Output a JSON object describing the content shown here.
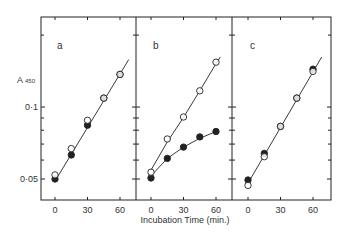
{
  "chart_data": {
    "type": "scatter",
    "title": "",
    "xlabel": "Incubation Time (min.)",
    "ylabel": "A 450",
    "ylabel_main": "A",
    "ylabel_sub": "450",
    "yscale": "log",
    "ylim": [
      0.045,
      0.21
    ],
    "xlim": [
      -13,
      77
    ],
    "xticks": [
      0,
      30,
      60
    ],
    "xtick_labels": [
      "0",
      "30",
      "60"
    ],
    "yticks_labeled": [
      0.05,
      0.1
    ],
    "ytick_labels": [
      "0·05",
      "0·1"
    ],
    "yticks_minor": [
      0.06,
      0.07,
      0.08,
      0.09,
      0.2
    ],
    "grid": false,
    "legend": "none",
    "marker_styles": {
      "open": "open circle",
      "filled": "filled circle",
      "half": "half-filled circle"
    },
    "panels": [
      {
        "label": "a",
        "x": [
          0,
          15,
          30,
          45,
          60
        ],
        "series": [
          {
            "name": "open",
            "marker": "open",
            "values": [
              0.052,
              0.067,
              0.088,
              0.109,
              0.137
            ]
          },
          {
            "name": "filled",
            "marker": "filled",
            "values": [
              0.05,
              0.063,
              0.084,
              0.109,
              0.137
            ]
          }
        ],
        "fit_lines": [
          {
            "x": [
              0,
              68
            ],
            "y": [
              0.049,
              0.158
            ]
          }
        ]
      },
      {
        "label": "b",
        "x": [
          0,
          15,
          30,
          45,
          60
        ],
        "series": [
          {
            "name": "open",
            "marker": "open",
            "values": [
              0.0534,
              0.0735,
              0.0909,
              0.117,
              0.154
            ]
          },
          {
            "name": "filled",
            "marker": "filled",
            "values": [
              0.0505,
              0.061,
              0.068,
              0.075,
              0.079
            ]
          }
        ],
        "fit_lines": [
          {
            "x": [
              0,
              15,
              30,
              45,
              60,
              64
            ],
            "y": [
              0.0545,
              0.0715,
              0.0905,
              0.117,
              0.152,
              0.162
            ]
          },
          {
            "x": [
              0,
              15,
              30,
              45,
              60
            ],
            "y": [
              0.0515,
              0.061,
              0.068,
              0.074,
              0.079
            ]
          }
        ]
      },
      {
        "label": "c",
        "x": [
          0,
          15,
          30,
          45,
          60
        ],
        "series": [
          {
            "name": "open",
            "marker": "open",
            "values": [
              0.047,
              0.062,
              0.083,
              0.109,
              0.141
            ]
          },
          {
            "name": "filled",
            "marker": "filled",
            "values": [
              0.0495,
              0.064,
              0.083,
              0.109,
              0.144
            ]
          }
        ],
        "fit_lines": [
          {
            "x": [
              0,
              68
            ],
            "y": [
              0.048,
              0.162
            ]
          }
        ]
      }
    ]
  }
}
